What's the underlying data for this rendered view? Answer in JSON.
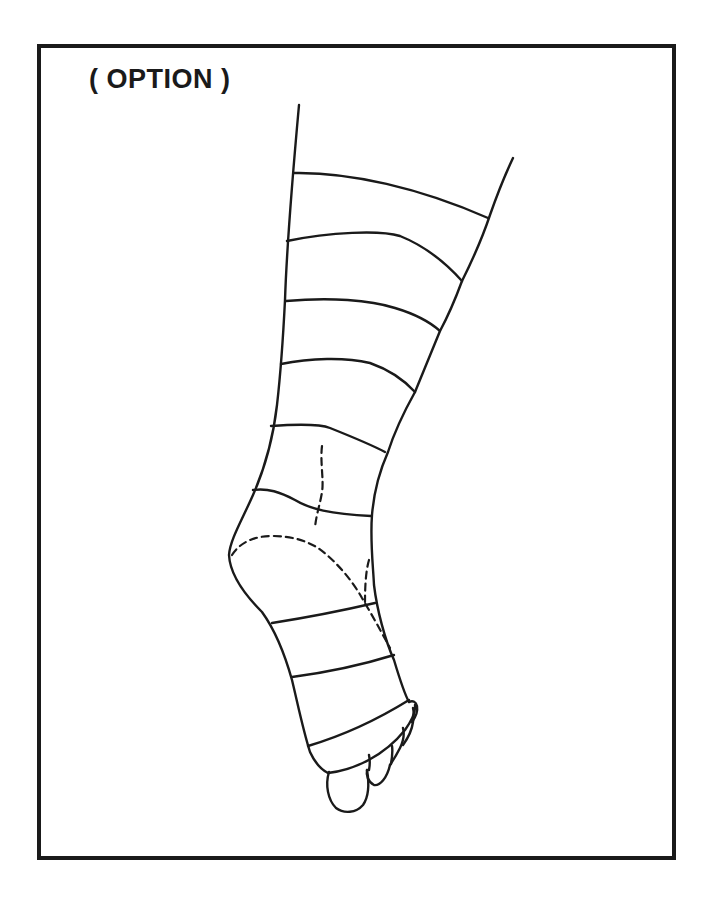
{
  "figure": {
    "label": "( OPTION )",
    "bandage_turns": 9,
    "colors": {
      "ink": "#1a1a1a",
      "background": "#ffffff"
    },
    "elements": {
      "frame": "border-frame",
      "outline": "leg-outline",
      "bands": "bandage-turn-lines",
      "dashed": "hidden-contour-dashed-lines",
      "toes": "toes"
    }
  }
}
